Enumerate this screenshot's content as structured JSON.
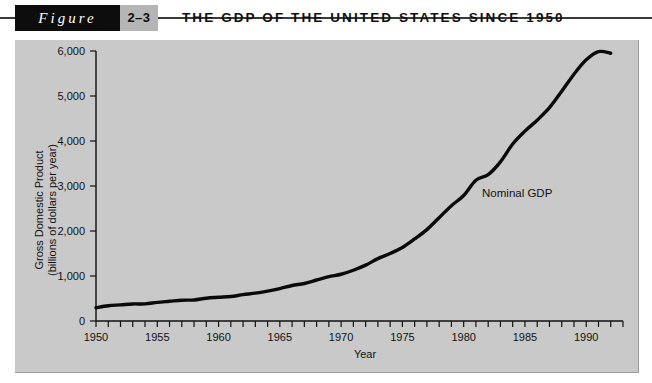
{
  "header": {
    "figure_word": "Figure",
    "figure_number": "2–3",
    "title": "THE GDP OF THE UNITED STATES SINCE 1950"
  },
  "chart_data": {
    "type": "line",
    "title": "THE GDP OF THE UNITED STATES SINCE 1950",
    "xlabel": "Year",
    "ylabel": "Gross Domestic Product (billions of dollars per year)",
    "ylabel_line1": "Gross Domestic Product",
    "ylabel_line2": "(billions of dollars per year)",
    "xlim": [
      1950,
      1993
    ],
    "ylim": [
      0,
      6000
    ],
    "grid": false,
    "legend": "none",
    "annotations": [
      {
        "text": "Nominal GDP",
        "x": 1981.5,
        "y": 2750
      }
    ],
    "ytick_labels": [
      "0",
      "1,000",
      "2,000",
      "3,000",
      "4,000",
      "5,000",
      "6,000"
    ],
    "ytick_values": [
      0,
      1000,
      2000,
      3000,
      4000,
      5000,
      6000
    ],
    "xtick_labels": [
      "1950",
      "1955",
      "1960",
      "1965",
      "1970",
      "1975",
      "1980",
      "1985",
      "1990"
    ],
    "xtick_values": [
      1950,
      1955,
      1960,
      1965,
      1970,
      1975,
      1980,
      1985,
      1990
    ],
    "xtick_minor_step": 1,
    "series": [
      {
        "name": "Nominal GDP",
        "color": "#0a0a0a",
        "x": [
          1950,
          1951,
          1952,
          1953,
          1954,
          1955,
          1956,
          1957,
          1958,
          1959,
          1960,
          1961,
          1962,
          1963,
          1964,
          1965,
          1966,
          1967,
          1968,
          1969,
          1970,
          1971,
          1972,
          1973,
          1974,
          1975,
          1976,
          1977,
          1978,
          1979,
          1980,
          1981,
          1982,
          1983,
          1984,
          1985,
          1986,
          1987,
          1988,
          1989,
          1990,
          1991,
          1992
        ],
        "values": [
          294,
          339,
          358,
          379,
          380,
          415,
          438,
          461,
          467,
          507,
          527,
          545,
          586,
          618,
          664,
          720,
          789,
          834,
          911,
          985,
          1039,
          1128,
          1241,
          1386,
          1501,
          1635,
          1824,
          2031,
          2296,
          2563,
          2790,
          3128,
          3255,
          3537,
          3933,
          4220,
          4463,
          4740,
          5104,
          5484,
          5803,
          5986,
          5950
        ]
      }
    ]
  }
}
